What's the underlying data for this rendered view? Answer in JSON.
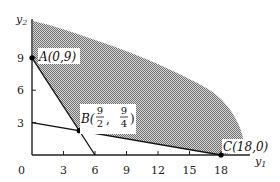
{
  "chart_data": {
    "type": "diagram",
    "title": "",
    "xlabel": "y1",
    "ylabel": "y2",
    "xlabel_main": "y",
    "xlabel_sub": "1",
    "ylabel_main": "y",
    "ylabel_sub": "2",
    "xlim": [
      0,
      20
    ],
    "ylim": [
      0,
      12.3
    ],
    "x_ticks": [
      3,
      6,
      9,
      12,
      15,
      18
    ],
    "x_tick_labels": [
      "3",
      "6",
      "9",
      "12",
      "15",
      "18"
    ],
    "y_ticks": [
      3,
      6,
      9
    ],
    "y_tick_labels": [
      "3",
      "6",
      "9"
    ],
    "origin_label": "0",
    "lines": [
      {
        "name": "constraint-line-1",
        "from": [
          0,
          9
        ],
        "to": [
          6,
          0
        ]
      },
      {
        "name": "constraint-line-2",
        "from": [
          0,
          3
        ],
        "to": [
          18,
          0
        ]
      }
    ],
    "points": [
      {
        "name": "A",
        "x": 0,
        "y": 9,
        "label": "A(0,9)"
      },
      {
        "name": "B",
        "x": 4.5,
        "y": 2.25,
        "label_prefix": "B(",
        "x_num": "9",
        "x_den": "2",
        "sep": ",",
        "y_num": "9",
        "y_den": "4",
        "label_suffix": ")"
      },
      {
        "name": "C",
        "x": 18,
        "y": 0,
        "label": "C(18,0)"
      }
    ],
    "feasible_region": {
      "description": "unbounded shaded region above A-B-C boundary",
      "fill": "#9a9a9a"
    }
  },
  "labels": {
    "A": "A(0,9)",
    "B_prefix": "B(",
    "B_x_num": "9",
    "B_x_den": "2",
    "B_sep": ",",
    "B_y_num": "9",
    "B_y_den": "4",
    "B_suffix": ")",
    "C": "C(18,0)"
  }
}
